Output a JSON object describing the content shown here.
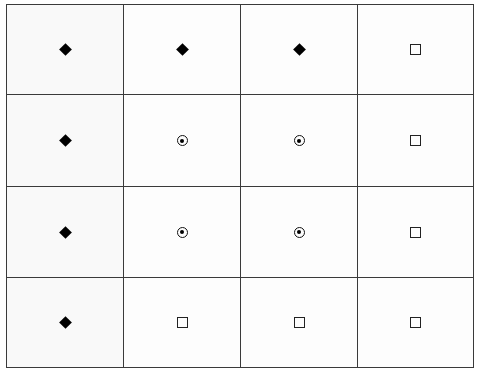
{
  "grid": {
    "rows": 4,
    "columns": 4,
    "legend_symbols": {
      "diamond": "filled-diamond",
      "circledot": "circled-dot",
      "square": "open-square"
    },
    "cells": [
      [
        "diamond",
        "diamond",
        "diamond",
        "square"
      ],
      [
        "diamond",
        "circledot",
        "circledot",
        "square"
      ],
      [
        "diamond",
        "circledot",
        "circledot",
        "square"
      ],
      [
        "diamond",
        "square",
        "square",
        "square"
      ]
    ],
    "colors": {
      "line": "#3a3a3a",
      "symbol": "#000000",
      "background": "#ffffff"
    }
  }
}
